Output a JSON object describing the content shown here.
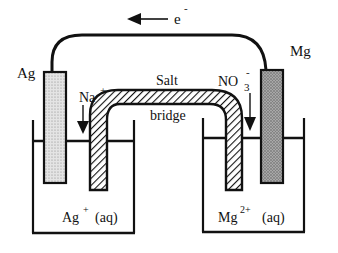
{
  "diagram": {
    "type": "galvanic-cell",
    "electron_flow": {
      "label": "e",
      "charge": "-",
      "direction": "left"
    },
    "electrodes": [
      {
        "id": "left",
        "label": "Ag",
        "fill": "#d8d8d8"
      },
      {
        "id": "right",
        "label": "Mg",
        "fill": "#9a9a9a"
      }
    ],
    "salt_bridge": {
      "label_line1": "Salt",
      "label_line2": "bridge",
      "cation": {
        "base": "Na",
        "charge": "+"
      },
      "anion": {
        "base": "NO",
        "subscript": "3",
        "charge": "-"
      }
    },
    "solutions": [
      {
        "id": "left",
        "ion": "Ag",
        "charge": "+",
        "state": "(aq)"
      },
      {
        "id": "right",
        "ion": "Mg",
        "charge": "2+",
        "state": "(aq)"
      }
    ],
    "colors": {
      "line": "#111111",
      "background": "#ffffff"
    }
  }
}
